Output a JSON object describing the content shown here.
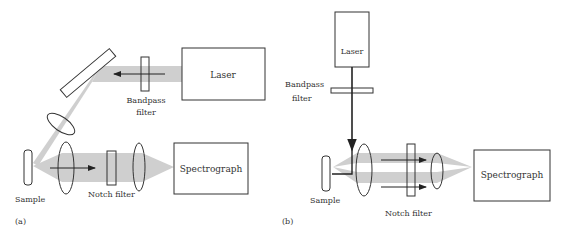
{
  "panel_a": {
    "tag": "(a)",
    "laser": "Laser",
    "bandpass_line1": "Bandpass",
    "bandpass_line2": "filter",
    "sample": "Sample",
    "notch": "Notch filter",
    "spectrograph": "Spectrograph"
  },
  "panel_b": {
    "tag": "(b)",
    "laser": "Laser",
    "bandpass_line1": "Bandpass",
    "bandpass_line2": "filter",
    "sample": "Sample",
    "notch": "Notch filter",
    "spectrograph": "Spectrograph"
  },
  "colors": {
    "beam": "#cfcfcf",
    "stroke": "#333333"
  }
}
